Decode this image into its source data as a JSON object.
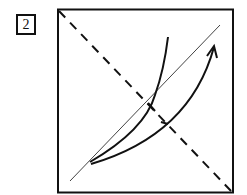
{
  "step": {
    "number": "2"
  },
  "diagram": {
    "type": "origami-fold-step",
    "elements": [
      "square paper outline",
      "dashed diagonal valley-fold line from top-left to bottom-right",
      "thin diagonal crease line from bottom-left toward top-right",
      "curved flap edge",
      "curved arrow indicating fold direction toward top-right"
    ],
    "colors": {
      "line": "#111111",
      "background": "#ffffff"
    }
  }
}
